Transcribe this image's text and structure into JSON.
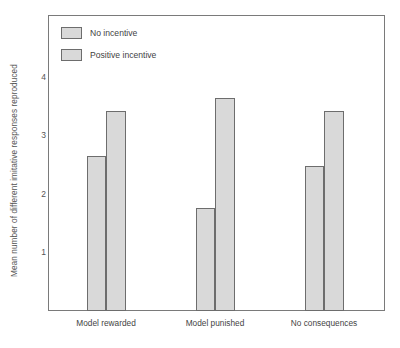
{
  "chart_data": {
    "type": "bar",
    "title": "",
    "xlabel": "",
    "ylabel": "Mean number of different imitative responses reproduced",
    "categories": [
      "Model rewarded",
      "Model punished",
      "No consequences"
    ],
    "series": [
      {
        "name": "No incentive",
        "values": [
          2.68,
          1.78,
          2.5
        ]
      },
      {
        "name": "Positive incentive",
        "values": [
          3.45,
          3.67,
          3.45
        ]
      }
    ],
    "ylim": [
      0,
      4.9
    ],
    "yticks": [
      1,
      2,
      3,
      4
    ],
    "ytick_labels": [
      "1",
      "2",
      "3",
      "4"
    ],
    "grid": false,
    "legend_position": "top-left",
    "colors": {
      "bar_fill": "#d9d9d9",
      "bar_border": "#6d6d6d",
      "frame": "#7a7a7a",
      "text": "#444444",
      "background": "#ffffff"
    }
  },
  "legend": {
    "items": [
      {
        "label": "No incentive"
      },
      {
        "label": "Positive incentive"
      }
    ]
  },
  "axes": {
    "y_title": "Mean number of different imitative responses reproduced",
    "y_tick_labels": [
      "4",
      "3",
      "2",
      "1"
    ],
    "x_tick_labels": [
      "Model rewarded",
      "Model punished",
      "No consequences"
    ]
  }
}
